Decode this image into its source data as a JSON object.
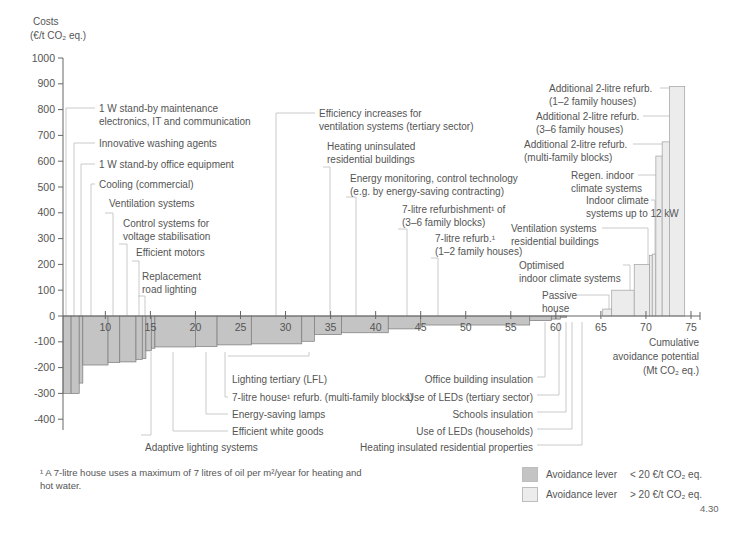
{
  "chart_data": {
    "type": "bar",
    "subtype": "marginal-abatement-cost-curve",
    "ylabel_line1": "Costs",
    "ylabel_line2": "(€/t CO₂ eq.)",
    "xlabel_lines": [
      "Cumulative",
      "avoidance potential",
      "(Mt CO₂ eq.)"
    ],
    "ylim": [
      -430,
      1000
    ],
    "xlim": [
      5.3,
      76
    ],
    "yticks": [
      1000,
      900,
      800,
      700,
      600,
      500,
      400,
      300,
      200,
      100,
      0,
      -100,
      -200,
      -300,
      -400
    ],
    "xticks": [
      10,
      15,
      20,
      25,
      30,
      35,
      40,
      45,
      50,
      55,
      60,
      65,
      70,
      75
    ],
    "grid": false,
    "bars": [
      {
        "x0": 5.3,
        "x1": 6.2,
        "value": -300,
        "cls": "low"
      },
      {
        "x0": 6.2,
        "x1": 7.1,
        "value": -300,
        "cls": "low"
      },
      {
        "x0": 7.1,
        "x1": 7.5,
        "value": -260,
        "cls": "low"
      },
      {
        "x0": 7.5,
        "x1": 10.3,
        "value": -190,
        "cls": "low"
      },
      {
        "x0": 10.3,
        "x1": 11.6,
        "value": -180,
        "cls": "low"
      },
      {
        "x0": 11.6,
        "x1": 13.4,
        "value": -178,
        "cls": "low"
      },
      {
        "x0": 13.4,
        "x1": 14.1,
        "value": -168,
        "cls": "low"
      },
      {
        "x0": 14.1,
        "x1": 14.5,
        "value": -165,
        "cls": "low"
      },
      {
        "x0": 14.5,
        "x1": 15.1,
        "value": -135,
        "cls": "low"
      },
      {
        "x0": 15.1,
        "x1": 15.5,
        "value": -125,
        "cls": "low"
      },
      {
        "x0": 15.5,
        "x1": 20.0,
        "value": -120,
        "cls": "low"
      },
      {
        "x0": 20.0,
        "x1": 22.4,
        "value": -118,
        "cls": "low"
      },
      {
        "x0": 22.4,
        "x1": 26.2,
        "value": -112,
        "cls": "low"
      },
      {
        "x0": 26.2,
        "x1": 31.8,
        "value": -108,
        "cls": "low"
      },
      {
        "x0": 31.8,
        "x1": 33.2,
        "value": -98,
        "cls": "low"
      },
      {
        "x0": 33.2,
        "x1": 36.2,
        "value": -72,
        "cls": "low"
      },
      {
        "x0": 36.2,
        "x1": 41.4,
        "value": -65,
        "cls": "low"
      },
      {
        "x0": 41.4,
        "x1": 45.0,
        "value": -50,
        "cls": "low"
      },
      {
        "x0": 45.0,
        "x1": 57.1,
        "value": -35,
        "cls": "low"
      },
      {
        "x0": 57.1,
        "x1": 59.5,
        "value": -18,
        "cls": "low"
      },
      {
        "x0": 59.5,
        "x1": 60.5,
        "value": -12,
        "cls": "low"
      },
      {
        "x0": 60.5,
        "x1": 61.2,
        "value": -5,
        "cls": "low"
      },
      {
        "x0": 65.2,
        "x1": 66.2,
        "value": 27,
        "cls": "high"
      },
      {
        "x0": 66.2,
        "x1": 68.7,
        "value": 100,
        "cls": "high"
      },
      {
        "x0": 68.7,
        "x1": 70.4,
        "value": 200,
        "cls": "high"
      },
      {
        "x0": 70.4,
        "x1": 70.7,
        "value": 235,
        "cls": "high"
      },
      {
        "x0": 70.7,
        "x1": 71.1,
        "value": 240,
        "cls": "high"
      },
      {
        "x0": 71.1,
        "x1": 71.8,
        "value": 620,
        "cls": "high"
      },
      {
        "x0": 71.8,
        "x1": 72.6,
        "value": 675,
        "cls": "high"
      },
      {
        "x0": 72.6,
        "x1": 74.3,
        "value": 890,
        "cls": "high"
      }
    ],
    "annotations_top": [
      {
        "lines": [
          "1 W stand-by maintenance",
          "electronics, IT and communication"
        ],
        "tx": 99,
        "ty": 108,
        "lx": 66,
        "ly": 108
      },
      {
        "lines": [
          "Innovative washing agents"
        ],
        "tx": 99,
        "ty": 143,
        "lx": 74,
        "ly": 143
      },
      {
        "lines": [
          "1 W stand-by office equipment"
        ],
        "tx": 99,
        "ty": 164,
        "lx": 81,
        "ly": 164
      },
      {
        "lines": [
          "Cooling (commercial)"
        ],
        "tx": 99,
        "ty": 184,
        "lx": 91,
        "ly": 184
      },
      {
        "lines": [
          "Ventilation systems"
        ],
        "tx": 109,
        "ty": 203,
        "lx": 113,
        "ly": 213
      },
      {
        "lines": [
          "Control systems for",
          "voltage stabilisation"
        ],
        "tx": 123,
        "ty": 223,
        "lx": 127,
        "ly": 244
      },
      {
        "lines": [
          "Efficient motors"
        ],
        "tx": 136,
        "ty": 252,
        "lx": 139,
        "ly": 261
      },
      {
        "lines": [
          "Replacement",
          "road lighting"
        ],
        "tx": 142,
        "ty": 276,
        "lx": 145,
        "ly": 296
      },
      {
        "lines": [
          "Efficiency increases for",
          "ventilation systems (tertiary sector)"
        ],
        "tx": 319,
        "ty": 113,
        "lx": 276,
        "ly": 113
      },
      {
        "lines": [
          "Heating uninsulated",
          "residential buildings"
        ],
        "tx": 327,
        "ty": 146,
        "lx": 330,
        "ly": 167
      },
      {
        "lines": [
          "Energy monitoring, control technology",
          "(e.g. by energy-saving contracting)"
        ],
        "tx": 350,
        "ty": 178,
        "lx": 356,
        "ly": 197
      },
      {
        "lines": [
          "7-litre refurbishment¹ of",
          "(3–6 family blocks)"
        ],
        "tx": 402,
        "ty": 209,
        "lx": 407,
        "ly": 229
      },
      {
        "lines": [
          "7-litre refurb.¹",
          "(1–2 family houses)"
        ],
        "tx": 435,
        "ty": 238,
        "lx": 438,
        "ly": 258
      }
    ],
    "annotations_right": [
      {
        "lines": [
          "Additional 2-litre refurb.",
          "(1–2 family houses)"
        ],
        "tx": 549,
        "ty": 88,
        "lx": 660,
        "ly": 88,
        "bx": 676
      },
      {
        "lines": [
          "Additional 2-litre refurb.",
          "(3–6 family houses)"
        ],
        "tx": 536,
        "ty": 116,
        "lx": 643,
        "ly": 116,
        "bx": 672
      },
      {
        "lines": [
          "Additional 2-litre refurb.",
          "(multi-family blocks)"
        ],
        "tx": 524,
        "ty": 144,
        "lx": 633,
        "ly": 144,
        "bx": 664
      },
      {
        "lines": [
          "Regen. indoor",
          "climate systems"
        ],
        "tx": 571,
        "ty": 175,
        "lx": 638,
        "ly": 175,
        "bx": 659
      },
      {
        "lines": [
          "Indoor climate",
          "systems up to 12 kW"
        ],
        "tx": 586,
        "ty": 200,
        "lx": 651,
        "ly": 200,
        "bx": 655
      },
      {
        "lines": [
          "Ventilation systems",
          "residential buildings"
        ],
        "tx": 511,
        "ty": 228,
        "lx": 602,
        "ly": 228,
        "bx": 648
      },
      {
        "lines": [
          "Optimised",
          "indoor climate systems"
        ],
        "tx": 519,
        "ty": 265,
        "lx": 623,
        "ly": 265,
        "bx": 630
      },
      {
        "lines": [
          "Passive",
          "house"
        ],
        "tx": 542,
        "ty": 295,
        "lx": 577,
        "ly": 295,
        "bx": 609
      }
    ],
    "annotations_bottom_left": [
      {
        "lines": [
          "Lighting tertiary (LFL)"
        ],
        "tx": 232,
        "ty": 379,
        "bx": 309,
        "ly": 356
      },
      {
        "lines": [
          "7-litre house¹ refurb. (multi-family blocks)"
        ],
        "tx": 232,
        "ty": 397,
        "bx": 225,
        "ly": 397
      },
      {
        "lines": [
          "Energy-saving lamps"
        ],
        "tx": 232,
        "ty": 414,
        "bx": 206,
        "ly": 414
      },
      {
        "lines": [
          "Efficient white goods"
        ],
        "tx": 232,
        "ty": 431,
        "bx": 173,
        "ly": 431
      },
      {
        "lines": [
          "Adaptive lighting systems"
        ],
        "tx": 145,
        "ty": 447,
        "bx": 151,
        "ly": 435
      }
    ],
    "annotations_bottom_right": [
      {
        "lines": [
          "Office building insulation"
        ],
        "tx": 533,
        "ty": 379,
        "bx": 545,
        "ly": 377
      },
      {
        "lines": [
          "Use of LEDs (tertiary sector)"
        ],
        "tx": 533,
        "ty": 397,
        "bx": 559,
        "ly": 395
      },
      {
        "lines": [
          "Schools insulation"
        ],
        "tx": 533,
        "ty": 414,
        "bx": 566,
        "ly": 412
      },
      {
        "lines": [
          "Use of LEDs (households)"
        ],
        "tx": 533,
        "ty": 431,
        "bx": 572,
        "ly": 429
      },
      {
        "lines": [
          "Heating insulated residential properties"
        ],
        "tx": 533,
        "ty": 447,
        "bx": 582,
        "ly": 445
      }
    ]
  },
  "legend": {
    "items": [
      {
        "label": "Avoidance lever",
        "range": "< 20 €/t CO₂ eq.",
        "color": "#c4c4c4"
      },
      {
        "label": "Avoidance lever",
        "range": "> 20 €/t CO₂ eq.",
        "color": "#ececec"
      }
    ]
  },
  "footnote": "¹ A 7-litre house uses a maximum of 7 litres of oil per m²/year for heating and hot water.",
  "figure_number": "4.30",
  "colors": {
    "low": "#c4c4c4",
    "high": "#ececec",
    "bar_stroke": "#8a8a8a",
    "axis": "#666666",
    "leader": "#bdbdbd"
  }
}
